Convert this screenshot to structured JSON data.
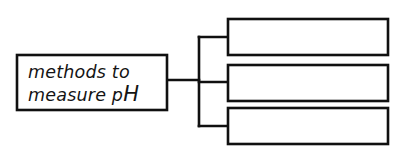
{
  "diagram": {
    "type": "concept-map",
    "background_color": "#ffffff",
    "line_color": "#101010",
    "text_color": "#141414",
    "root": {
      "label_line1": "methods to",
      "label_line2_prefix": "measure p",
      "label_line2_suffix": "H",
      "label_full": "methods to measure pH",
      "box": {
        "x": 17,
        "y": 55,
        "width": 150,
        "height": 55
      }
    },
    "branches": [
      {
        "name": "branch-1",
        "label": "",
        "box": {
          "x": 228,
          "y": 19,
          "width": 160,
          "height": 36
        },
        "connector_y": 37
      },
      {
        "name": "branch-2",
        "label": "",
        "box": {
          "x": 228,
          "y": 65,
          "width": 160,
          "height": 36
        },
        "connector_y": 82
      },
      {
        "name": "branch-3",
        "label": "",
        "box": {
          "x": 228,
          "y": 108,
          "width": 160,
          "height": 36
        },
        "connector_y": 126
      }
    ],
    "trunk": {
      "stem_y": 80,
      "stem_x_start": 167,
      "trunk_x": 199,
      "trunk_y_top": 37,
      "trunk_y_bottom": 126
    }
  }
}
